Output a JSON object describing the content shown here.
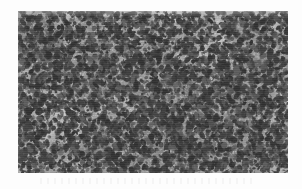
{
  "figure": {
    "kind": "micrograph",
    "panel": {
      "x": 18,
      "y": 11,
      "width": 270,
      "height": 162
    },
    "caption": "",
    "scale_bar": "",
    "magnification_label": ""
  },
  "appearance": {
    "page_background": "#fdfdfd",
    "matrix_color": "#cfcfcf",
    "matrix_light": "#e2e2e2",
    "matrix_mid": "#c4c4c4",
    "matrix_dark": "#a9a9a9",
    "particle_color": "#2e2e2e",
    "particle_dark": "#1d1d1d",
    "particle_soft": "#4f4f4f",
    "border_color": "#b4b4b4"
  },
  "texture": {
    "particle_count": 5200,
    "particle_min_size": 1.1,
    "particle_max_size": 3.4,
    "particle_elongation": 1.9,
    "grain_noise_count": 9000,
    "area_fraction_percent": 27,
    "seed": 20240517
  },
  "chart_data": {
    "type": "heatmap",
    "title": "",
    "xlabel": "",
    "ylabel": "",
    "legend": []
  }
}
